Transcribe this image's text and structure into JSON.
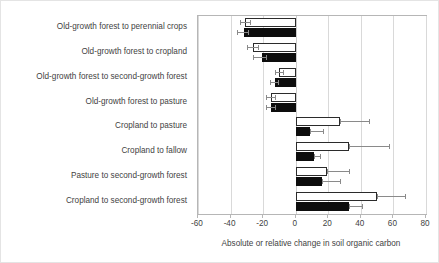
{
  "chart_data": {
    "type": "bar",
    "orientation": "horizontal",
    "title": "",
    "xlabel": "Absolute or relative change in soil organic carbon",
    "ylabel": "",
    "xlim": [
      -60,
      80
    ],
    "xticks": [
      -60,
      -40,
      -20,
      0,
      20,
      40,
      60,
      80
    ],
    "xtick_labels": [
      "-60",
      "-40",
      "-20",
      "0",
      "20",
      "40",
      "60",
      "80"
    ],
    "grid": true,
    "legend": "none",
    "categories": [
      "Old-growth forest to perennial crops",
      "Old-growth forest to cropland",
      "Old-growth forest to second-growth forest",
      "Old-growth forest to pasture",
      "Cropland to pasture",
      "Cropland to fallow",
      "Pasture to second-growth forest",
      "Cropland to second-growth forest"
    ],
    "series": [
      {
        "name": "open",
        "style": "white-filled-black-outline",
        "values": [
          -31,
          -26,
          -10,
          -15,
          27,
          33,
          19,
          50
        ],
        "err_low": [
          -34,
          -30,
          -13,
          -18,
          27,
          33,
          19,
          50
        ],
        "err_high": [
          -28,
          -23,
          -8,
          -13,
          45,
          57,
          33,
          67
        ]
      },
      {
        "name": "filled",
        "style": "solid-black",
        "values": [
          -32,
          -21,
          -13,
          -15,
          9,
          11,
          16,
          33
        ],
        "err_low": [
          -36,
          -26,
          -16,
          -18,
          9,
          11,
          16,
          33
        ],
        "err_high": [
          -29,
          -18,
          -11,
          -13,
          17,
          15,
          27,
          41
        ]
      }
    ]
  },
  "axis": {
    "x_title": "Absolute or relative change in soil organic carbon"
  }
}
